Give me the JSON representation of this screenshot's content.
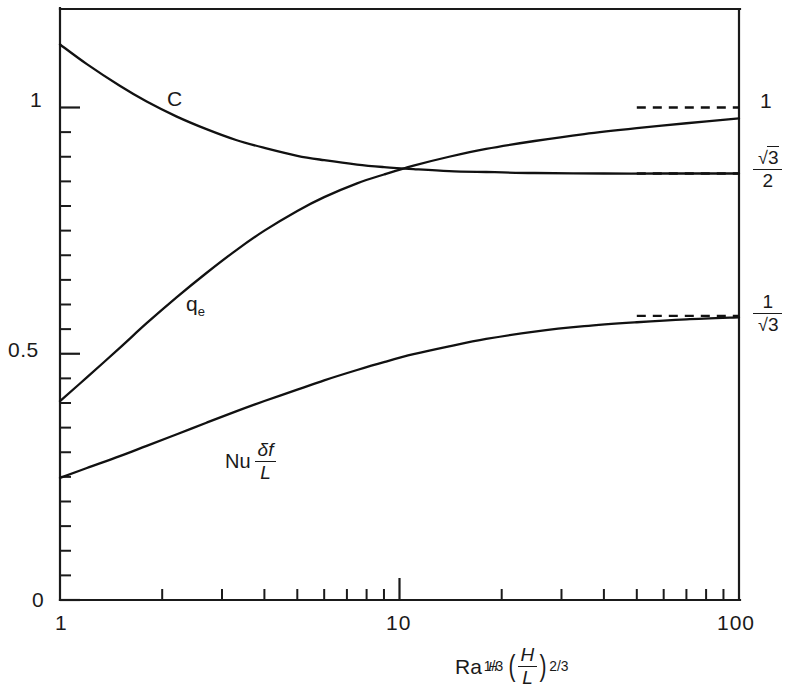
{
  "chart_data": {
    "type": "line",
    "title": "",
    "xlabel": "Ra_H^(1/3) (H/L)^(2/3)",
    "ylabel": "",
    "xscale": "log",
    "xlim": [
      1,
      100
    ],
    "ylim": [
      0,
      1.2
    ],
    "grid": false,
    "legend": "inline-curve-labels",
    "x_tick_labels": [
      "1",
      "10",
      "100"
    ],
    "x_tick_values": [
      1,
      10,
      100
    ],
    "x_minor_ticks": [
      2,
      3,
      4,
      5,
      6,
      7,
      8,
      9,
      20,
      30,
      40,
      50,
      60,
      70,
      80,
      90
    ],
    "y_tick_labels": [
      "0",
      "0.5",
      "1"
    ],
    "y_tick_values": [
      0,
      0.5,
      1
    ],
    "y_minor_tick_step": 0.05,
    "right_axis_labels": [
      {
        "text": "1",
        "value": 1.0,
        "kind": "plain"
      },
      {
        "text": "√3/2",
        "value": 0.866,
        "kind": "fraction",
        "numerator": "√3",
        "denominator": "2"
      },
      {
        "text": "1/√3",
        "value": 0.577,
        "kind": "fraction",
        "numerator": "1",
        "denominator": "√3"
      }
    ],
    "series": [
      {
        "name": "C",
        "label": "C",
        "asymptote_value": 0.866,
        "asymptote_label": "√3/2",
        "points": [
          [
            1.0,
            1.128
          ],
          [
            1.2,
            1.088
          ],
          [
            1.5,
            1.044
          ],
          [
            1.8,
            1.012
          ],
          [
            2.2,
            0.982
          ],
          [
            2.7,
            0.956
          ],
          [
            3.3,
            0.934
          ],
          [
            4.0,
            0.918
          ],
          [
            5.0,
            0.902
          ],
          [
            6.0,
            0.893
          ],
          [
            7.5,
            0.884
          ],
          [
            9.0,
            0.879
          ],
          [
            11.0,
            0.875
          ],
          [
            14.0,
            0.871
          ],
          [
            18.0,
            0.869
          ],
          [
            25.0,
            0.867
          ],
          [
            40.0,
            0.866
          ],
          [
            60.0,
            0.866
          ],
          [
            100.0,
            0.866
          ]
        ]
      },
      {
        "name": "q_e",
        "label": "q_e",
        "asymptote_value": 1.0,
        "asymptote_label": "1",
        "points": [
          [
            1.0,
            0.404
          ],
          [
            1.2,
            0.452
          ],
          [
            1.5,
            0.512
          ],
          [
            1.8,
            0.562
          ],
          [
            2.2,
            0.614
          ],
          [
            2.7,
            0.664
          ],
          [
            3.3,
            0.71
          ],
          [
            4.0,
            0.75
          ],
          [
            5.0,
            0.79
          ],
          [
            6.0,
            0.818
          ],
          [
            7.5,
            0.846
          ],
          [
            9.0,
            0.864
          ],
          [
            11.0,
            0.882
          ],
          [
            14.0,
            0.9
          ],
          [
            18.0,
            0.916
          ],
          [
            25.0,
            0.932
          ],
          [
            35.0,
            0.946
          ],
          [
            50.0,
            0.958
          ],
          [
            70.0,
            0.968
          ],
          [
            100.0,
            0.978
          ]
        ]
      },
      {
        "name": "Nu*delta_f/L",
        "label": "Nu δf/L",
        "asymptote_value": 0.577,
        "asymptote_label": "1/√3",
        "points": [
          [
            1.0,
            0.248
          ],
          [
            1.2,
            0.268
          ],
          [
            1.5,
            0.292
          ],
          [
            1.8,
            0.313
          ],
          [
            2.2,
            0.336
          ],
          [
            2.7,
            0.36
          ],
          [
            3.3,
            0.383
          ],
          [
            4.0,
            0.404
          ],
          [
            5.0,
            0.427
          ],
          [
            6.0,
            0.446
          ],
          [
            7.5,
            0.467
          ],
          [
            9.0,
            0.483
          ],
          [
            11.0,
            0.499
          ],
          [
            14.0,
            0.515
          ],
          [
            18.0,
            0.53
          ],
          [
            25.0,
            0.545
          ],
          [
            35.0,
            0.556
          ],
          [
            50.0,
            0.564
          ],
          [
            70.0,
            0.57
          ],
          [
            100.0,
            0.574
          ]
        ]
      }
    ],
    "asymptote_dashed_lines": [
      {
        "series": "q_e",
        "value": 1.0,
        "x_start": 50,
        "x_end": 100
      },
      {
        "series": "C",
        "value": 0.866,
        "x_start": 50,
        "x_end": 100
      },
      {
        "series": "Nu*delta_f/L",
        "value": 0.577,
        "x_start": 50,
        "x_end": 100
      }
    ]
  },
  "labels": {
    "y_zero": "0",
    "y_half": "0.5",
    "y_one": "1",
    "x_one": "1",
    "x_ten": "10",
    "x_hundred": "100",
    "curve_c": "C",
    "curve_qe_base": "q",
    "curve_qe_sub": "e",
    "curve_nu_text": "Nu",
    "curve_nu_num": "δf",
    "curve_nu_den": "L",
    "right_one": "1",
    "right_sqrt3_num": "3",
    "right_sqrt3_den": "2",
    "right_inv_num": "1",
    "right_inv_den": "3",
    "xcap_ra": "Ra",
    "xcap_ra_sub": "H",
    "xcap_ra_sup": "1/3",
    "xcap_paren_open": "(",
    "xcap_paren_close": ")",
    "xcap_frac_num": "H",
    "xcap_frac_den": "L",
    "xcap_sup": "2/3"
  },
  "style": {
    "ink": "#1a1a1a",
    "background": "#ffffff"
  }
}
